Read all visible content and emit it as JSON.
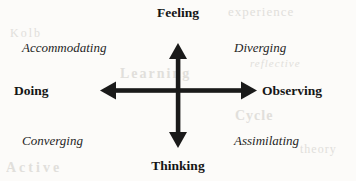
{
  "diagram": {
    "type": "quadrant-axes",
    "title_present": false,
    "background_color": "#fcfbf9",
    "ink_color": "#1a1a1a",
    "axes": {
      "vertical": {
        "top_label": "Feeling",
        "bottom_label": "Thinking",
        "double_headed": true,
        "top_tip_y": 43,
        "bottom_tip_y": 148,
        "x": 178
      },
      "horizontal": {
        "left_label": "Doing",
        "right_label": "Observing",
        "double_headed": true,
        "left_tip_x": 100,
        "right_tip_x": 257,
        "y": 91
      },
      "center": {
        "x": 178,
        "y": 91
      }
    },
    "quadrants": [
      {
        "position": "top-left",
        "label": "Accommodating"
      },
      {
        "position": "top-right",
        "label": "Diverging"
      },
      {
        "position": "bottom-left",
        "label": "Converging"
      },
      {
        "position": "bottom-right",
        "label": "Assimilating"
      }
    ],
    "bleed_through": {
      "b1": "experience",
      "b2": "Kolb",
      "b3": "Learning",
      "b4": "Cycle",
      "b5": "Active",
      "b6": "reflective",
      "b7": "theory"
    }
  }
}
